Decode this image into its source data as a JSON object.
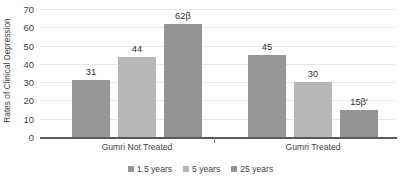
{
  "chart_data": {
    "type": "bar",
    "title": "",
    "xlabel": "",
    "ylabel": "Rates of Clinical Depression",
    "ylim": [
      0,
      70
    ],
    "ytick_labels": [
      "0",
      "10",
      "20",
      "30",
      "40",
      "50",
      "60",
      "70"
    ],
    "ytick_values": [
      0,
      10,
      20,
      30,
      40,
      50,
      60,
      70
    ],
    "grid": "horizontal",
    "legend_position": "bottom-center",
    "categories": [
      "Gumri Not Treated",
      "Gumri Treated"
    ],
    "series": [
      {
        "name": "1.5 years",
        "color": "#969696",
        "values": [
          31,
          45
        ],
        "labels": [
          "31",
          "45"
        ]
      },
      {
        "name": "5 years",
        "color": "#b7b7b7",
        "values": [
          44,
          30
        ],
        "labels": [
          "44",
          "30"
        ]
      },
      {
        "name": "25 years",
        "color": "#939393",
        "values": [
          62,
          15
        ],
        "labels": [
          "62β",
          "15β'"
        ]
      }
    ]
  },
  "axis": {
    "y_title": "Rates of Clinical Depression"
  },
  "legend": {
    "items": [
      {
        "label": "1.5 years",
        "color": "#969696"
      },
      {
        "label": "5 years",
        "color": "#b7b7b7"
      },
      {
        "label": "25 years",
        "color": "#939393"
      }
    ]
  }
}
